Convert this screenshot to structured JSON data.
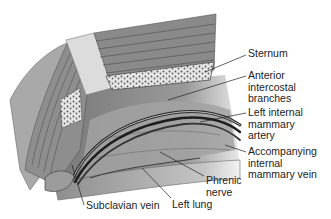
{
  "figure": {
    "type": "anatomical-illustration",
    "colors": {
      "background": "#ffffff",
      "muscle": "#8a8a8a",
      "muscle_dark": "#5a5a5a",
      "bone": "#d8d8d8",
      "vessel": "#2a2a2a",
      "lung": "#b8b8b8",
      "leader_line": "#222222",
      "label_text": "#222222"
    }
  },
  "labels": [
    {
      "id": "sternum",
      "lines": [
        "Sternum"
      ]
    },
    {
      "id": "anterior-intercostal-branches",
      "lines": [
        "Anterior",
        "intercostal",
        "branches"
      ]
    },
    {
      "id": "left-internal-mammary-artery",
      "lines": [
        "Left internal",
        "mammary",
        "artery"
      ]
    },
    {
      "id": "accompanying-internal-mammary-vein",
      "lines": [
        "Accompanying",
        "internal",
        "mammary vein"
      ]
    },
    {
      "id": "phrenic-nerve",
      "lines": [
        "Phrenic",
        "nerve"
      ]
    },
    {
      "id": "left-lung",
      "lines": [
        "Left lung"
      ]
    },
    {
      "id": "subclavian-vein",
      "lines": [
        "Subclavian vein"
      ]
    }
  ]
}
